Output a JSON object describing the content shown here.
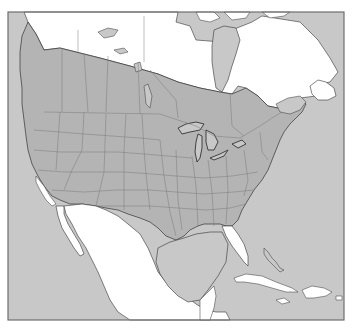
{
  "map": {
    "type": "species-range-map",
    "region": "North America",
    "frame": {
      "x": 8,
      "y": 12,
      "width": 336,
      "height": 308
    },
    "colors": {
      "background": "#ffffff",
      "water": "#c8c8c8",
      "land_outside_range": "#ffffff",
      "range": "#b4b4b4",
      "borders": "#7a7a7a",
      "coastline": "#333333",
      "frame": "#6e6e6e"
    },
    "legend": [
      {
        "label": "Range",
        "color": "#b4b4b4"
      }
    ],
    "range_description": "Gray shading covers southern Canada and most of the contiguous United States; absent from the far north (Yukon, NWT, Nunavut, northern Quebec/Labrador), Newfoundland, southern Florida, the California coast fringe, Baja California, mainland Mexico and the Caribbean islands."
  }
}
